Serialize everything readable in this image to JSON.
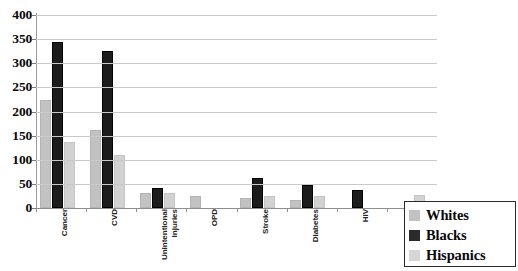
{
  "chart_data": {
    "type": "bar",
    "title": "",
    "subtitle": "",
    "xlabel": "",
    "ylabel": "",
    "ylim": [
      0,
      400
    ],
    "ytick_step": 50,
    "yticks": [
      0,
      50,
      100,
      150,
      200,
      250,
      300,
      350,
      400
    ],
    "ytick_labels": [
      "0",
      "50",
      "100",
      "150",
      "200",
      "250",
      "300",
      "350",
      "400"
    ],
    "grid": true,
    "grid_axis": "y",
    "legend_position": "bottom-right",
    "categories": [
      "Cancer",
      "CVD",
      "Unintentional\nInjuries",
      "OPD",
      "Stroke",
      "Diabetes",
      "HIV",
      "Liver"
    ],
    "series": [
      {
        "name": "Whites",
        "color": "#c2c2c2",
        "values": [
          223,
          162,
          32,
          25,
          20,
          17,
          null,
          null
        ]
      },
      {
        "name": "Blacks",
        "color": "#1c1c1c",
        "values": [
          345,
          326,
          42,
          null,
          62,
          48,
          38,
          null
        ]
      },
      {
        "name": "Hispanics",
        "color": "#d2d2d2",
        "values": [
          137,
          110,
          32,
          null,
          25,
          25,
          null,
          27
        ]
      }
    ]
  },
  "legend": {
    "items": [
      {
        "label": "Whites",
        "swatch_class": "series-whites"
      },
      {
        "label": "Blacks",
        "swatch_class": "series-blacks"
      },
      {
        "label": "Hispanics",
        "swatch_class": "series-hispanics"
      }
    ]
  }
}
